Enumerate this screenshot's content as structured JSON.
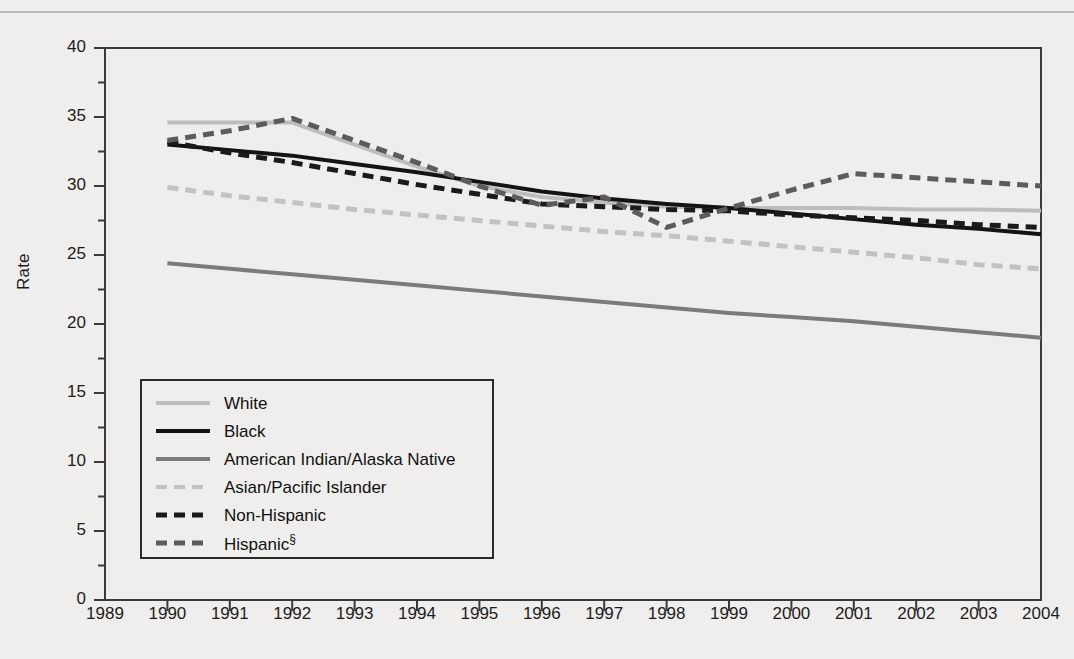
{
  "figure": {
    "background_color": "#efeeec",
    "frame_color": "#3a3a3a"
  },
  "axes": {
    "ylabel": "Rate",
    "yticks": [
      "0",
      "5",
      "10",
      "15",
      "20",
      "25",
      "30",
      "35",
      "40"
    ],
    "xticks": [
      "1989",
      "1990",
      "1991",
      "1992",
      "1993",
      "1994",
      "1995",
      "1996",
      "1997",
      "1998",
      "1999",
      "2000",
      "2001",
      "2002",
      "2003",
      "2004"
    ]
  },
  "legend": {
    "items": [
      {
        "label": "White",
        "color": "#bdbdbd",
        "style": "solid",
        "width": 4
      },
      {
        "label": "Black",
        "color": "#131313",
        "style": "solid",
        "width": 4
      },
      {
        "label": "American Indian/Alaska Native",
        "color": "#7b7b7b",
        "style": "solid",
        "width": 4
      },
      {
        "label": "Asian/Pacific Islander",
        "color": "#c2c2c2",
        "style": "dashed",
        "width": 4
      },
      {
        "label": "Non-Hispanic",
        "color": "#1a1a1a",
        "style": "dashed",
        "width": 5
      },
      {
        "label": "Hispanic",
        "label_suffix": "§",
        "color": "#5c5c5c",
        "style": "dashed",
        "width": 5
      }
    ]
  },
  "chart_data": {
    "type": "line",
    "title": "",
    "xlabel": "",
    "ylabel": "Rate",
    "xlim": [
      1989,
      2004
    ],
    "ylim": [
      0,
      40
    ],
    "grid": false,
    "legend_position": "inside-lower-left",
    "x": [
      1990,
      1991,
      1992,
      1993,
      1994,
      1995,
      1996,
      1997,
      1998,
      1999,
      2000,
      2001,
      2002,
      2003,
      2004
    ],
    "series": [
      {
        "name": "White",
        "color": "#bdbdbd",
        "style": "solid",
        "values": [
          34.6,
          34.6,
          34.6,
          33.0,
          31.4,
          30.0,
          29.2,
          28.8,
          28.5,
          28.4,
          28.4,
          28.4,
          28.3,
          28.3,
          28.2
        ]
      },
      {
        "name": "Black",
        "color": "#131313",
        "style": "solid",
        "values": [
          33.0,
          32.6,
          32.2,
          31.6,
          31.0,
          30.3,
          29.6,
          29.1,
          28.7,
          28.4,
          28.0,
          27.6,
          27.2,
          26.9,
          26.5
        ]
      },
      {
        "name": "American Indian/Alaska Native",
        "color": "#7b7b7b",
        "style": "solid",
        "values": [
          24.4,
          24.0,
          23.6,
          23.2,
          22.8,
          22.4,
          22.0,
          21.6,
          21.2,
          20.8,
          20.5,
          20.2,
          19.8,
          19.4,
          19.0
        ]
      },
      {
        "name": "Asian/Pacific Islander",
        "color": "#c2c2c2",
        "style": "dashed",
        "values": [
          29.9,
          29.3,
          28.8,
          28.3,
          27.9,
          27.5,
          27.1,
          26.7,
          26.4,
          26.0,
          25.6,
          25.2,
          24.8,
          24.3,
          24.0
        ]
      },
      {
        "name": "Non-Hispanic",
        "color": "#1a1a1a",
        "style": "dashed",
        "values": [
          33.2,
          32.4,
          31.7,
          30.9,
          30.1,
          29.4,
          28.7,
          28.5,
          28.3,
          28.2,
          27.9,
          27.7,
          27.5,
          27.2,
          27.0
        ]
      },
      {
        "name": "Hispanic",
        "color": "#5c5c5c",
        "style": "dashed",
        "values": [
          33.3,
          34.0,
          34.9,
          33.3,
          31.7,
          30.0,
          28.6,
          29.2,
          27.0,
          28.4,
          29.7,
          30.9,
          30.6,
          30.3,
          30.0
        ]
      }
    ]
  }
}
